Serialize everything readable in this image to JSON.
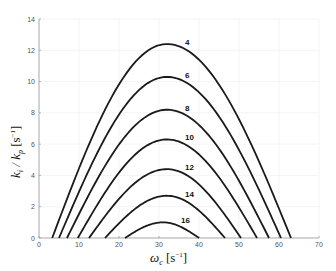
{
  "chart_data": {
    "type": "line",
    "title": "",
    "xlabel": "ω_c [s^-1]",
    "ylabel": "k_i / k_p [s^-1]",
    "xlim": [
      0,
      70
    ],
    "ylim": [
      0,
      14
    ],
    "xticks": [
      0,
      10,
      20,
      30,
      40,
      50,
      60,
      70
    ],
    "yticks": [
      0,
      2,
      4,
      6,
      8,
      10,
      12,
      14
    ],
    "grid": true,
    "legend": "inline labels at curve peaks",
    "series": [
      {
        "name": "4",
        "x_left_root": 3.3,
        "x_peak": 32,
        "y_peak": 12.4,
        "x_right_root": 63.0
      },
      {
        "name": "6",
        "x_left_root": 5.0,
        "x_peak": 32,
        "y_peak": 10.3,
        "x_right_root": 60.5
      },
      {
        "name": "8",
        "x_left_root": 7.0,
        "x_peak": 32,
        "y_peak": 8.2,
        "x_right_root": 57.5
      },
      {
        "name": "10",
        "x_left_root": 9.7,
        "x_peak": 32,
        "y_peak": 6.3,
        "x_right_root": 54.5
      },
      {
        "name": "12",
        "x_left_root": 12.5,
        "x_peak": 32,
        "y_peak": 4.4,
        "x_right_root": 50.5
      },
      {
        "name": "14",
        "x_left_root": 16.5,
        "x_peak": 32,
        "y_peak": 2.7,
        "x_right_root": 46.5
      },
      {
        "name": "16",
        "x_left_root": 21.5,
        "x_peak": 31,
        "y_peak": 1.0,
        "x_right_root": 40.0
      }
    ]
  }
}
